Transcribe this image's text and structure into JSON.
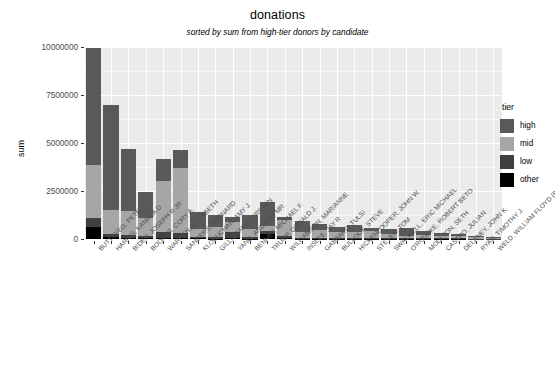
{
  "chart_data": {
    "type": "bar",
    "title": "donations",
    "subtitle": "sorted by sum from high-tier donors by candidate",
    "xlabel": "",
    "ylabel": "sum",
    "ylim": [
      0,
      10000000
    ],
    "ytick_labels": [
      "0",
      "2500000",
      "5000000",
      "7500000",
      "10000000"
    ],
    "ytick_values": [
      0,
      2500000,
      5000000,
      7500000,
      10000000
    ],
    "grid": true,
    "stacked": true,
    "legend_title": "tier",
    "legend_position": "right",
    "legend_entries": [
      "high",
      "mid",
      "low",
      "other"
    ],
    "colors": {
      "high": "#595959",
      "mid": "#a6a6a6",
      "low": "#404040",
      "other": "#000000",
      "panel": "#ebebeb",
      "gridline": "#ffffff"
    },
    "categories": [
      "BUTTIGIEG, PETE",
      "HARRIS, KAMALA D",
      "BIDEN, JOSEPH R JR",
      "BOOKER, CORY A.",
      "WARREN, ELIZABETH",
      "SANDERS, BERNARD",
      "KLOBUCHAR, AMY J.",
      "GILLIBRAND, KIRSTEN",
      "YANG, ANDREW MR.",
      "BENNET, MICHAEL F.",
      "TRUMP, DONALD J.",
      "WILLIAMSON, MARIANNE",
      "INSLEE, JAY R",
      "GABBARD, TULSI",
      "BULLOCK, STEVE",
      "HICKENLOOPER, JOHN W.",
      "STEYER, TOM",
      "SWALWELL, ERIC MICHAEL",
      "O'ROURKE, ROBERT BETO",
      "MOULTON, SETH",
      "CASTRO, JULIAN",
      "DELANEY, JOHN K.",
      "RYAN, TIMOTHY J.",
      "WELD, WILLIAM FLOYD (BILL)"
    ],
    "series": [
      {
        "name": "high",
        "values": [
          6100000,
          5450000,
          3250000,
          1350000,
          1150000,
          950000,
          850000,
          600000,
          300000,
          700000,
          1250000,
          150000,
          600000,
          300000,
          250000,
          350000,
          180000,
          260000,
          420000,
          180000,
          160000,
          120000,
          60000,
          40000
        ]
      },
      {
        "name": "mid",
        "values": [
          2750000,
          1250000,
          1250000,
          950000,
          2700000,
          3400000,
          420000,
          550000,
          500000,
          450000,
          260000,
          830000,
          280000,
          420000,
          300000,
          300000,
          330000,
          220000,
          120000,
          180000,
          120000,
          110000,
          90000,
          40000
        ]
      },
      {
        "name": "low",
        "values": [
          480000,
          180000,
          150000,
          130000,
          280000,
          250000,
          90000,
          80000,
          330000,
          60000,
          160000,
          150000,
          60000,
          60000,
          60000,
          60000,
          50000,
          40000,
          30000,
          30000,
          30000,
          25000,
          20000,
          10000
        ]
      },
      {
        "name": "other",
        "values": [
          620000,
          80000,
          60000,
          40000,
          60000,
          50000,
          30000,
          20000,
          40000,
          20000,
          240000,
          30000,
          15000,
          15000,
          15000,
          15000,
          12000,
          10000,
          8000,
          8000,
          8000,
          6000,
          5000,
          3000
        ]
      }
    ],
    "totals": [
      9950000,
      6960000,
      4710000,
      2470000,
      4190000,
      4650000,
      1390000,
      1250000,
      1170000,
      1230000,
      1910000,
      1160000,
      955000,
      795000,
      625000,
      725000,
      572000,
      530000,
      578000,
      398000,
      318000,
      261000,
      175000,
      93000
    ]
  }
}
